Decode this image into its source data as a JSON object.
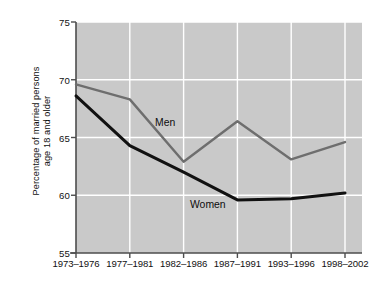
{
  "chart_data": {
    "type": "line",
    "title": "",
    "subtitle": "",
    "xlabel": "",
    "ylabel": "Percentage of married persons age 18 and older",
    "ylabel_line1": "Percentage of married persons",
    "ylabel_line2": "age 18 and older",
    "categories": [
      "1973–1976",
      "1977–1981",
      "1982–1986",
      "1987–1991",
      "1993–1996",
      "1998–2002"
    ],
    "ylim": [
      55,
      75
    ],
    "yticks": [
      55,
      60,
      65,
      70,
      75
    ],
    "ytick_labels": [
      "55",
      "60",
      "65",
      "70",
      "75"
    ],
    "grid": true,
    "grid_color": "#ffffff",
    "legend": "inline-annotations",
    "legend_position": "inside-plot",
    "plot_background": "#c9c9c9",
    "series": [
      {
        "name": "Men",
        "color": "#6e6e6e",
        "line_width": 2.4,
        "values": [
          69.6,
          68.3,
          62.9,
          66.4,
          63.1,
          64.6
        ],
        "label_x_category": "1982–1986",
        "label_text": "Men"
      },
      {
        "name": "Women",
        "color": "#111111",
        "line_width": 3.0,
        "values": [
          68.6,
          64.3,
          62.0,
          59.6,
          59.7,
          60.2
        ],
        "label_x_category": "1987–1991",
        "label_text": "Women"
      }
    ],
    "annotations": [
      {
        "text": "Men",
        "series": "Men"
      },
      {
        "text": "Women",
        "series": "Women"
      }
    ]
  },
  "axis": {
    "y_title_line1": "Percentage of married persons",
    "y_title_line2": "age 18 and older"
  }
}
